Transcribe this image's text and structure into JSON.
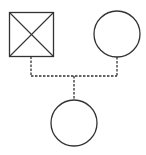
{
  "diagram": {
    "type": "pedigree",
    "stroke_color": "#333333",
    "background": "#ffffff",
    "father": {
      "shape": "square",
      "status": "deceased",
      "x": 9,
      "y": 12,
      "size": 44
    },
    "mother": {
      "shape": "circle",
      "status": "living",
      "cx": 117,
      "cy": 34,
      "r": 23
    },
    "child": {
      "shape": "circle",
      "status": "living",
      "cx": 74,
      "cy": 123,
      "r": 23
    },
    "relationship_line_style": "dashed"
  }
}
